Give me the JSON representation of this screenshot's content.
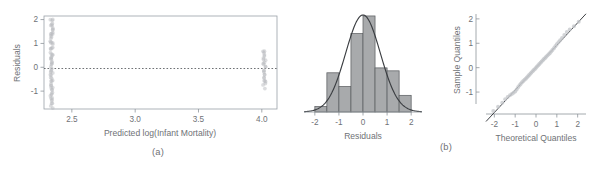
{
  "figure": {
    "caption_a": "(a)",
    "caption_b": "(b)"
  },
  "chart_data": [
    {
      "type": "scatter",
      "panel": "a",
      "title": "",
      "xlabel": "Predicted log(Infant Mortality)",
      "ylabel": "Residuals",
      "xticks": [
        "2.5",
        "3.0",
        "3.5",
        "4.0"
      ],
      "xtick_values": [
        2.5,
        3.0,
        3.5,
        4.0
      ],
      "yticks": [
        "-1",
        "0",
        "1",
        "2"
      ],
      "ytick_values": [
        -1,
        0,
        1,
        2
      ],
      "xlim": [
        2.28,
        4.12
      ],
      "ylim": [
        -1.75,
        2.15
      ],
      "grid": false,
      "reference_line": {
        "type": "horizontal",
        "y": 0,
        "style": "dashed"
      },
      "clusters": [
        {
          "x": 2.34,
          "y_min": -1.65,
          "y_max": 2.05,
          "n": 70
        },
        {
          "x": 4.02,
          "y_min": -0.85,
          "y_max": 0.7,
          "n": 26
        }
      ],
      "note": "Overplotted residuals at two predicted values"
    },
    {
      "type": "bar",
      "panel": "b",
      "title": "",
      "xlabel": "Residuals",
      "ylabel": "",
      "xticks": [
        "-2",
        "-1",
        "0",
        "1",
        "2"
      ],
      "xtick_values": [
        -2,
        -1,
        0,
        1,
        2
      ],
      "xlim": [
        -2.45,
        2.45
      ],
      "ylim": [
        0,
        1
      ],
      "grid": false,
      "bin_edges": [
        -2.0,
        -1.5,
        -1.0,
        -0.5,
        0.0,
        0.5,
        1.0,
        1.5,
        2.0
      ],
      "values": [
        0.055,
        0.4,
        0.26,
        0.8,
        0.98,
        0.45,
        0.42,
        0.17
      ],
      "overlay": {
        "type": "normal_density",
        "mean": 0.0,
        "sd": 0.72,
        "peak": 0.99
      }
    },
    {
      "type": "scatter",
      "panel": "c",
      "title": "",
      "xlabel": "Theoretical Quantiles",
      "ylabel": "Sample Quantiles",
      "xticks": [
        "-2",
        "-1",
        "0",
        "1",
        "2"
      ],
      "xtick_values": [
        -2,
        -1,
        0,
        1,
        2
      ],
      "yticks": [
        "-1",
        "0",
        "1",
        "2"
      ],
      "ytick_values": [
        -1,
        0,
        1,
        2
      ],
      "xlim": [
        -2.4,
        2.4
      ],
      "ylim": [
        -1.9,
        2.2
      ],
      "grid": false,
      "reference_line": {
        "type": "identity",
        "slope": 0.92,
        "intercept": 0.0,
        "style": "solid"
      },
      "points_x": [
        -2.05,
        -1.82,
        -1.62,
        -1.48,
        -1.36,
        -1.25,
        -1.16,
        -1.08,
        -1.0,
        -0.93,
        -0.86,
        -0.79,
        -0.73,
        -0.67,
        -0.61,
        -0.55,
        -0.49,
        -0.44,
        -0.38,
        -0.33,
        -0.27,
        -0.22,
        -0.16,
        -0.11,
        -0.05,
        0.0,
        0.05,
        0.11,
        0.16,
        0.22,
        0.27,
        0.33,
        0.38,
        0.44,
        0.49,
        0.55,
        0.61,
        0.67,
        0.73,
        0.79,
        0.86,
        0.93,
        1.0,
        1.08,
        1.16,
        1.25,
        1.36,
        1.48,
        1.62,
        1.82,
        2.05
      ],
      "points_y": [
        -1.78,
        -1.6,
        -1.44,
        -1.3,
        -1.2,
        -1.13,
        -1.08,
        -1.03,
        -0.98,
        -0.9,
        -0.8,
        -0.72,
        -0.66,
        -0.6,
        -0.55,
        -0.5,
        -0.45,
        -0.4,
        -0.35,
        -0.3,
        -0.25,
        -0.2,
        -0.15,
        -0.1,
        -0.05,
        0.0,
        0.05,
        0.1,
        0.15,
        0.2,
        0.25,
        0.3,
        0.35,
        0.4,
        0.45,
        0.5,
        0.55,
        0.6,
        0.66,
        0.72,
        0.8,
        0.88,
        0.96,
        1.04,
        1.12,
        1.22,
        1.34,
        1.46,
        1.56,
        1.7,
        1.88
      ]
    }
  ]
}
